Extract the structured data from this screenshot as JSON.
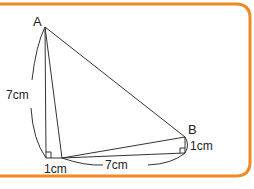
{
  "diagram": {
    "type": "geometry-figure",
    "frame_color": "#F08A24",
    "line_color": "#333333",
    "points": {
      "A": {
        "label": "A",
        "x": 45,
        "y": 27
      },
      "B": {
        "label": "B",
        "x": 185,
        "y": 137
      },
      "C": {
        "x": 46,
        "y": 158
      },
      "D": {
        "x": 62,
        "y": 158
      },
      "E": {
        "x": 185,
        "y": 153
      }
    },
    "labels": {
      "point_a": "A",
      "point_b": "B",
      "left_length": "7cm",
      "bottom_small": "1cm",
      "bottom_length": "7cm",
      "right_small": "1cm"
    }
  }
}
